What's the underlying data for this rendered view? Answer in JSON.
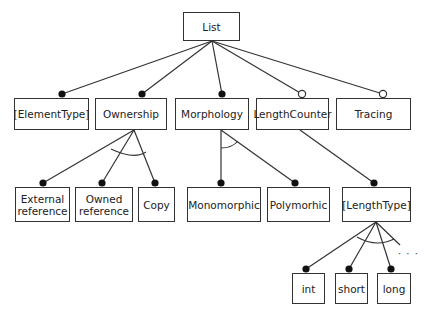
{
  "diagram": {
    "type": "feature-diagram",
    "root": {
      "id": "list",
      "label": "List"
    },
    "nodes": [
      {
        "id": "list",
        "label": "List",
        "x": 183,
        "y": 12,
        "w": 57,
        "h": 29
      },
      {
        "id": "elementtype",
        "label": "[ElementType]",
        "x": 14,
        "y": 98,
        "w": 75,
        "h": 32
      },
      {
        "id": "ownership",
        "label": "Ownership",
        "x": 95,
        "y": 98,
        "w": 72,
        "h": 32
      },
      {
        "id": "morphology",
        "label": "Morphology",
        "x": 175,
        "y": 98,
        "w": 74,
        "h": 32
      },
      {
        "id": "lengthcounter",
        "label": "LengthCounter",
        "x": 256,
        "y": 98,
        "w": 73,
        "h": 32
      },
      {
        "id": "tracing",
        "label": "Tracing",
        "x": 336,
        "y": 98,
        "w": 75,
        "h": 32
      },
      {
        "id": "external",
        "label": "External reference",
        "x": 15,
        "y": 187,
        "w": 55,
        "h": 35
      },
      {
        "id": "owned",
        "label": "Owned reference",
        "x": 75,
        "y": 187,
        "w": 58,
        "h": 35
      },
      {
        "id": "copy",
        "label": "Copy",
        "x": 138,
        "y": 187,
        "w": 37,
        "h": 35
      },
      {
        "id": "monomorphic",
        "label": "Monomorphic",
        "x": 187,
        "y": 187,
        "w": 74,
        "h": 35
      },
      {
        "id": "polymorhic",
        "label": "Polymorhic",
        "x": 267,
        "y": 187,
        "w": 63,
        "h": 35
      },
      {
        "id": "lengthtype",
        "label": "[LengthType]",
        "x": 342,
        "y": 187,
        "w": 69,
        "h": 35
      },
      {
        "id": "int",
        "label": "int",
        "x": 292,
        "y": 273,
        "w": 33,
        "h": 31
      },
      {
        "id": "short",
        "label": "short",
        "x": 335,
        "y": 273,
        "w": 33,
        "h": 31
      },
      {
        "id": "long",
        "label": "long",
        "x": 377,
        "y": 273,
        "w": 34,
        "h": 31
      }
    ],
    "edges": [
      {
        "from": "list",
        "to": "elementtype",
        "end": "filled",
        "x1": 212,
        "y1": 41,
        "x2": 62,
        "y2": 94
      },
      {
        "from": "list",
        "to": "ownership",
        "end": "filled",
        "x1": 212,
        "y1": 41,
        "x2": 142,
        "y2": 94
      },
      {
        "from": "list",
        "to": "morphology",
        "end": "filled",
        "x1": 212,
        "y1": 41,
        "x2": 222,
        "y2": 94
      },
      {
        "from": "list",
        "to": "lengthcounter",
        "end": "hollow",
        "x1": 212,
        "y1": 41,
        "x2": 302,
        "y2": 94
      },
      {
        "from": "list",
        "to": "tracing",
        "end": "hollow",
        "x1": 212,
        "y1": 41,
        "x2": 383,
        "y2": 94
      },
      {
        "from": "ownership",
        "to": "external",
        "end": "filled",
        "x1": 134,
        "y1": 130,
        "x2": 43,
        "y2": 183
      },
      {
        "from": "ownership",
        "to": "owned",
        "end": "filled",
        "x1": 134,
        "y1": 130,
        "x2": 102,
        "y2": 183
      },
      {
        "from": "ownership",
        "to": "copy",
        "end": "filled",
        "x1": 134,
        "y1": 130,
        "x2": 155,
        "y2": 183
      },
      {
        "from": "morphology",
        "to": "monomorphic",
        "end": "filled",
        "x1": 221,
        "y1": 130,
        "x2": 221,
        "y2": 183
      },
      {
        "from": "morphology",
        "to": "polymorhic",
        "end": "filled",
        "x1": 221,
        "y1": 130,
        "x2": 295,
        "y2": 183
      },
      {
        "from": "lengthcounter",
        "to": "lengthtype",
        "end": "filled",
        "x1": 300,
        "y1": 130,
        "x2": 374,
        "y2": 183
      },
      {
        "from": "lengthtype",
        "to": "int",
        "end": "filled",
        "x1": 376,
        "y1": 222,
        "x2": 306,
        "y2": 269
      },
      {
        "from": "lengthtype",
        "to": "short",
        "end": "filled",
        "x1": 376,
        "y1": 222,
        "x2": 349,
        "y2": 269
      },
      {
        "from": "lengthtype",
        "to": "long",
        "end": "filled",
        "x1": 376,
        "y1": 222,
        "x2": 391,
        "y2": 269
      },
      {
        "from": "lengthtype",
        "to": "more",
        "end": "none",
        "x1": 376,
        "y1": 222,
        "x2": 400,
        "y2": 245
      }
    ],
    "groups": [
      {
        "parent": "ownership",
        "kind": "alternative",
        "arc": "M111,149 Q134,160 146,152"
      },
      {
        "parent": "morphology",
        "kind": "alternative",
        "arc": "M221,148 Q232,148 238,141"
      },
      {
        "parent": "lengthtype",
        "kind": "alternative",
        "arc": "M357,237 Q376,248 394,239"
      }
    ],
    "ellipsis": {
      "label": "· · ·",
      "x": 398,
      "y": 248
    }
  }
}
